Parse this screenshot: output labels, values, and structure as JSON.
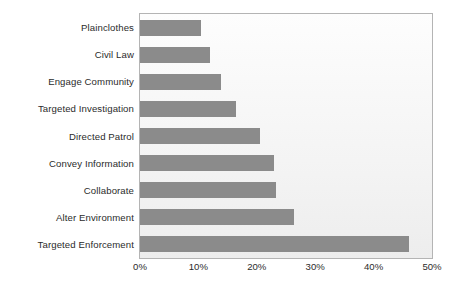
{
  "chart_data": {
    "type": "bar",
    "orientation": "horizontal",
    "title": "",
    "subtitle": "",
    "xlabel": "",
    "ylabel": "",
    "categories": [
      "Plainclothes",
      "Civil Law",
      "Engage Community",
      "Targeted Investigation",
      "Directed Patrol",
      "Convey Information",
      "Collaborate",
      "Alter Environment",
      "Targeted Enforcement"
    ],
    "values": [
      10.5,
      12.0,
      13.8,
      16.5,
      20.5,
      23.0,
      23.3,
      26.3,
      46.0
    ],
    "value_suffix": "%",
    "xlim": [
      0,
      50
    ],
    "xticks": [
      0,
      10,
      20,
      30,
      40,
      50
    ],
    "xtick_labels": [
      "0%",
      "10%",
      "20%",
      "30%",
      "40%",
      "50%"
    ],
    "grid": false,
    "legend": null,
    "legend_position": "none",
    "bar_color": "#8b8b8b",
    "plot_background": "#f4f4f4",
    "plot_border_color": "#b4b4b4",
    "text_color": "#2b2b2b"
  }
}
